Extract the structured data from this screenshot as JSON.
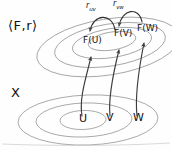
{
  "figure": {
    "title_top_left": "⟨F,r⟩",
    "title_bottom_left": "X",
    "background_color": "#fefefe",
    "ink_color": "#555555",
    "text_color": "#111111"
  },
  "upper_plane": {
    "name": "sheaf-data-plane",
    "label": "⟨F,r⟩",
    "sections": [
      {
        "id": "FU",
        "label": "F(U)"
      },
      {
        "id": "FV",
        "label": "F(V)"
      },
      {
        "id": "FW",
        "label": "F(W)"
      }
    ],
    "nested_ellipse_count": 4
  },
  "lower_plane": {
    "name": "base-space-plane",
    "label": "X",
    "open_sets": [
      {
        "id": "U",
        "label": "U"
      },
      {
        "id": "V",
        "label": "V"
      },
      {
        "id": "W",
        "label": "W"
      }
    ],
    "nested_ellipse_count": 3
  },
  "restriction_maps": [
    {
      "id": "r_uv",
      "base": "r",
      "sub": "uv",
      "from": "F(V)",
      "to": "F(U)"
    },
    {
      "id": "r_vw",
      "base": "r",
      "sub": "vw",
      "from": "F(W)",
      "to": "F(V)"
    }
  ],
  "section_arrows": [
    {
      "id": "arrow-U-FU",
      "from": "U",
      "to": "F(U)"
    },
    {
      "id": "arrow-V-FV",
      "from": "V",
      "to": "F(V)"
    },
    {
      "id": "arrow-W-FW",
      "from": "W",
      "to": "F(W)"
    }
  ]
}
